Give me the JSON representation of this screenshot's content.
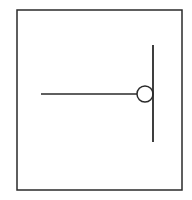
{
  "diagram": {
    "type": "line-symbol",
    "canvas": {
      "width": 192,
      "height": 200,
      "background": "#ffffff"
    },
    "stroke_color": "#2a2a2a",
    "frame": {
      "x": 17,
      "y": 10,
      "width": 165,
      "height": 180,
      "stroke_width": 1.5
    },
    "horizontal_line": {
      "x1": 41,
      "y1": 94,
      "x2": 137,
      "y2": 94,
      "stroke_width": 1.5
    },
    "circle": {
      "cx": 145,
      "cy": 94,
      "r": 8,
      "stroke_width": 1.5,
      "fill": "#ffffff"
    },
    "vertical_line": {
      "x1": 153,
      "y1": 45,
      "x2": 153,
      "y2": 142,
      "stroke_width": 1.8
    }
  }
}
